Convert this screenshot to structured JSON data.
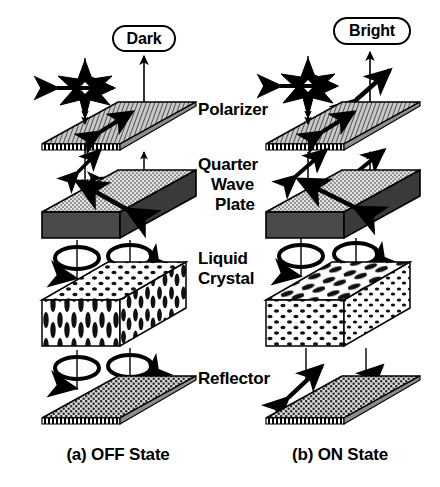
{
  "figure": {
    "badges": {
      "left": "Dark",
      "right": "Bright"
    },
    "layer_labels": [
      "Polarizer",
      "Quarter",
      "Wave",
      "Plate",
      "Liquid",
      "Crystal",
      "Reflector"
    ],
    "layers": [
      {
        "id": "polarizer",
        "name": "Polarizer",
        "lines": [
          "Polarizer"
        ]
      },
      {
        "id": "quarter-wave",
        "name": "Quarter Wave Plate",
        "lines": [
          "Quarter",
          "Wave",
          "Plate"
        ]
      },
      {
        "id": "liquid-crystal",
        "name": "Liquid Crystal",
        "lines": [
          "Liquid",
          "Crystal"
        ]
      },
      {
        "id": "reflector",
        "name": "Reflector",
        "lines": [
          "Reflector"
        ]
      }
    ],
    "state_captions": {
      "left": "(a) OFF State",
      "right": "(b)  ON State"
    },
    "colors": {
      "ink": "#000000",
      "background": "#ffffff",
      "polarizer_fill": "#b4b4b4",
      "waveplate_top_fill": "#d2d2d2",
      "waveplate_side_fill": "#4a4a4a",
      "reflector_fill": "#a8a8a8",
      "lc_fill": "#ffffff"
    }
  }
}
